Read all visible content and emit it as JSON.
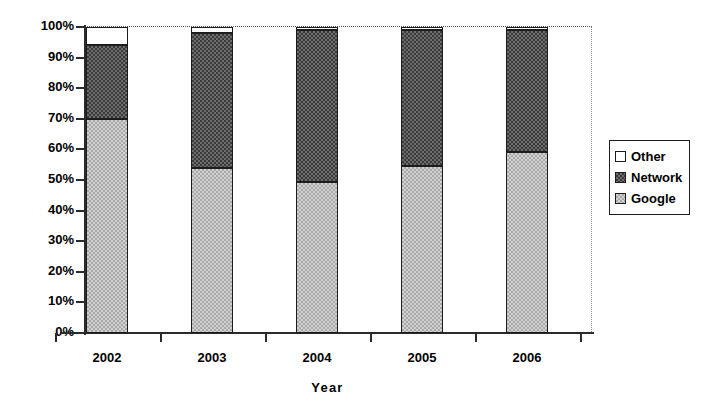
{
  "chart_data": {
    "type": "bar",
    "subtype": "stacked-percent",
    "title": "",
    "xlabel": "Year",
    "ylabel": "",
    "categories": [
      "2002",
      "2003",
      "2004",
      "2005",
      "2006"
    ],
    "ylim": [
      0,
      100
    ],
    "ytick_labels": [
      "0%",
      "10%",
      "20%",
      "30%",
      "40%",
      "50%",
      "60%",
      "70%",
      "80%",
      "90%",
      "100%"
    ],
    "ytick_values": [
      0,
      10,
      20,
      30,
      40,
      50,
      60,
      70,
      80,
      90,
      100
    ],
    "grid": "top-dotted-only",
    "legend_position": "right",
    "series": [
      {
        "name": "Google",
        "values": [
          70.0,
          54.0,
          49.5,
          54.5,
          59.0
        ],
        "color": "#d2d2d2",
        "pattern": "light-checker"
      },
      {
        "name": "Network",
        "values": [
          24.0,
          44.0,
          49.5,
          44.5,
          40.0
        ],
        "color": "#6d6d6d",
        "pattern": "dark-checker"
      },
      {
        "name": "Other",
        "values": [
          6.0,
          2.0,
          1.0,
          1.0,
          1.0
        ],
        "color": "#ffffff",
        "pattern": "solid-white"
      }
    ],
    "cumulative_tops": {
      "Google": [
        70.0,
        54.0,
        49.5,
        54.5,
        59.0
      ],
      "Network": [
        94.0,
        98.0,
        99.0,
        99.0,
        99.0
      ],
      "Other": [
        100.0,
        100.0,
        100.0,
        100.0,
        100.0
      ]
    }
  },
  "legend": {
    "items": [
      {
        "label": "Other",
        "swatch": "white-square"
      },
      {
        "label": "Network",
        "swatch": "dark-checker-square"
      },
      {
        "label": "Google",
        "swatch": "light-checker-square"
      }
    ]
  },
  "axis": {
    "x_title": "Year"
  }
}
